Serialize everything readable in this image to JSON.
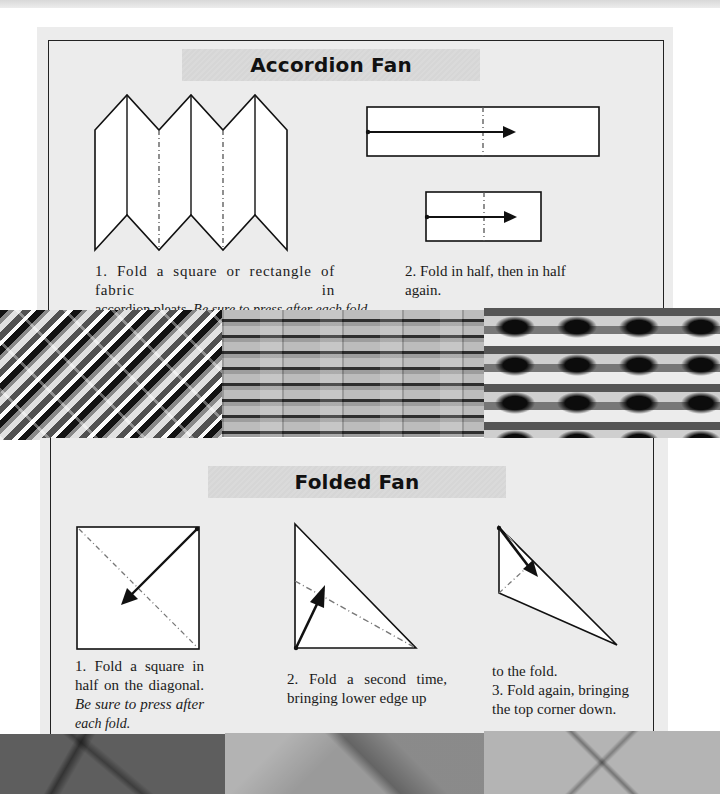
{
  "sections": [
    {
      "title": "Accordion Fan",
      "steps": [
        {
          "number": "1.",
          "text": "Fold a square or rectangle of fabric in accordion pleats.",
          "line1": "1. Fold a square or rectangle of fabric in",
          "line2_plain": "accordion pleats. ",
          "line2_italic": "Be sure to press after each fold.",
          "diagram": "accordion-pleats-diagram"
        },
        {
          "number": "2.",
          "line1": "2. Fold in half, then in half",
          "line2": "again.",
          "diagrams": [
            "fold-in-half-diagram",
            "fold-in-half-again-diagram"
          ]
        }
      ],
      "fabric_swatches": [
        "diagonal-stripe-fabric",
        "horizontal-stripe-fabric",
        "spotted-band-fabric"
      ]
    },
    {
      "title": "Folded Fan",
      "steps": [
        {
          "number": "1.",
          "line1": "1. Fold a square in",
          "line2": "half on the diagonal.",
          "line3_italic": "Be sure to press after",
          "line4_italic": "each fold.",
          "diagram": "square-diagonal-fold-diagram"
        },
        {
          "number": "2.",
          "line1": "2. Fold a second time,",
          "line2": "bringing lower edge up",
          "diagram": "triangle-second-fold-diagram"
        },
        {
          "number": "3.",
          "line0": "to the fold.",
          "line1": "3. Fold again, bringing",
          "line2": "the top corner down.",
          "diagram": "triangle-third-fold-diagram"
        }
      ],
      "fabric_swatches": [
        "dark-crease-fabric",
        "mid-gray-crease-fabric",
        "light-diamond-crease-fabric"
      ]
    }
  ],
  "colors": {
    "panel_bg": "#ececec",
    "frame": "#222222",
    "title_band": "#d8d8d8",
    "fold_line": "#777777"
  }
}
